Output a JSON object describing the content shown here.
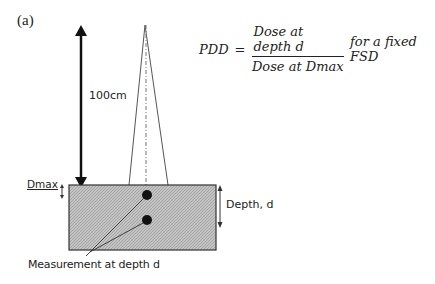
{
  "panel_label": "(a)",
  "distance_label": "100cm",
  "dmax_label": "Dmax",
  "depth_label": "Depth, d",
  "measurement_label": "Measurement at depth d",
  "formula": {
    "lhs": "PDD",
    "equals": "=",
    "numerator": "Dose at depth d",
    "denominator": "Dose at Dmax",
    "condition": "for a fixed FSD"
  },
  "colors": {
    "ink": "#222222",
    "phantom_fill": "#bdbdbd",
    "background": "#ffffff"
  }
}
